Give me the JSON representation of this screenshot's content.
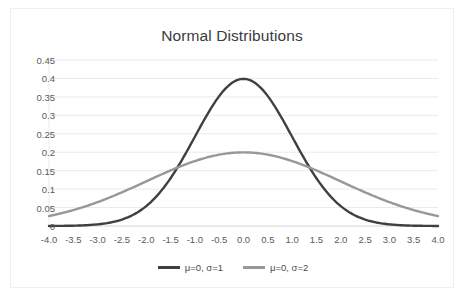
{
  "chart_data": {
    "type": "line",
    "title": "Normal Distributions",
    "xlabel": "",
    "ylabel": "",
    "xlim": [
      -4.0,
      4.0
    ],
    "ylim": [
      0,
      0.45
    ],
    "grid": true,
    "legend_position": "bottom",
    "x_tick_labels": [
      "-4.0",
      "-3.5",
      "-3.0",
      "-2.5",
      "-2.0",
      "-1.5",
      "-1.0",
      "-0.5",
      "0.0",
      "0.5",
      "1.0",
      "1.5",
      "2.0",
      "2.5",
      "3.0",
      "3.5",
      "4.0"
    ],
    "x_tick_values": [
      -4.0,
      -3.5,
      -3.0,
      -2.5,
      -2.0,
      -1.5,
      -1.0,
      -0.5,
      0.0,
      0.5,
      1.0,
      1.5,
      2.0,
      2.5,
      3.0,
      3.5,
      4.0
    ],
    "y_tick_labels": [
      "0",
      "0.05",
      "0.1",
      "0.15",
      "0.2",
      "0.25",
      "0.3",
      "0.35",
      "0.4",
      "0.45"
    ],
    "y_tick_values": [
      0,
      0.05,
      0.1,
      0.15,
      0.2,
      0.25,
      0.3,
      0.35,
      0.4,
      0.45
    ],
    "x": [
      -4.0,
      -3.5,
      -3.0,
      -2.5,
      -2.0,
      -1.5,
      -1.0,
      -0.5,
      0.0,
      0.5,
      1.0,
      1.5,
      2.0,
      2.5,
      3.0,
      3.5,
      4.0
    ],
    "series": [
      {
        "name": "μ=0, σ=1",
        "color": "#404040",
        "values": [
          0.0001,
          0.0009,
          0.0044,
          0.0175,
          0.054,
          0.1295,
          0.242,
          0.3521,
          0.3989,
          0.3521,
          0.242,
          0.1295,
          0.054,
          0.0175,
          0.0044,
          0.0009,
          0.0001
        ]
      },
      {
        "name": "μ=0, σ=2",
        "color": "#989898",
        "values": [
          0.027,
          0.0417,
          0.0605,
          0.0826,
          0.108,
          0.133,
          0.176,
          0.1933,
          0.1995,
          0.1933,
          0.176,
          0.133,
          0.108,
          0.0826,
          0.0605,
          0.0417,
          0.027
        ]
      }
    ],
    "colors": {
      "series_1": "#404040",
      "series_2": "#989898",
      "gridline": "#e8eaec",
      "axis_line": "#d0d3d6",
      "tick_text": "#5a5a5a",
      "title_text": "#3b3b3b",
      "card_border": "#eceef0",
      "background": "#ffffff"
    }
  },
  "legend": {
    "items": [
      {
        "label": "μ=0, σ=1"
      },
      {
        "label": "μ=0, σ=2"
      }
    ]
  }
}
